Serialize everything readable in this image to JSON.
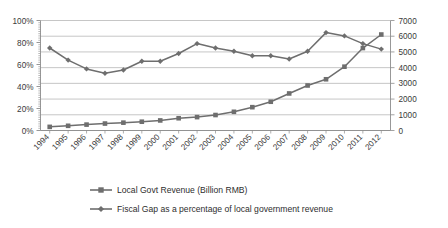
{
  "chart_data": {
    "type": "line",
    "title": "",
    "subtitle": "",
    "xlabel": "",
    "ylabel": "",
    "y2label": "",
    "grid": true,
    "legend_position": "bottom",
    "categories": [
      "1994",
      "1995",
      "1996",
      "1997",
      "1998",
      "1999",
      "2000",
      "2001",
      "2002",
      "2003",
      "2004",
      "2005",
      "2006",
      "2007",
      "2008",
      "2009",
      "2010",
      "2011",
      "2012"
    ],
    "axes": {
      "left": {
        "ticks": [
          "0%",
          "20%",
          "40%",
          "60%",
          "80%",
          "100%"
        ],
        "values": [
          0,
          20,
          40,
          60,
          80,
          100
        ],
        "min": 0,
        "max": 100,
        "unit": "%"
      },
      "right": {
        "ticks": [
          "0",
          "1000",
          "2000",
          "3000",
          "4000",
          "5000",
          "6000",
          "7000"
        ],
        "values": [
          0,
          1000,
          2000,
          3000,
          4000,
          5000,
          6000,
          7000
        ],
        "min": 0,
        "max": 7000,
        "unit": "Billion RMB"
      }
    },
    "series": [
      {
        "name": "Local Govt Revenue (Billion RMB)",
        "axis": "right",
        "marker": "square",
        "color": "#6e6e6e",
        "values": [
          231,
          299,
          375,
          442,
          499,
          559,
          640,
          780,
          852,
          985,
          1190,
          1484,
          1830,
          2357,
          2865,
          3260,
          4061,
          5247,
          6108
        ]
      },
      {
        "name": "Fiscal Gap as a percentage of local government revenue",
        "axis": "left",
        "marker": "diamond",
        "color": "#6e6e6e",
        "values": [
          75,
          64,
          56,
          52,
          55,
          63,
          63,
          70,
          79,
          75,
          72,
          68,
          68,
          65,
          72,
          89,
          86,
          79,
          74
        ]
      }
    ]
  },
  "legend": {
    "items": [
      {
        "label": "Local Govt Revenue (Billion RMB)",
        "marker": "square"
      },
      {
        "label": "Fiscal Gap as a percentage of local government revenue",
        "marker": "diamond"
      }
    ]
  },
  "colors": {
    "series_gray": "#6e6e6e",
    "gridline": "#b8b8b8",
    "axis": "#8c8c8c",
    "text": "#3a3a3a",
    "background": "#ffffff"
  }
}
